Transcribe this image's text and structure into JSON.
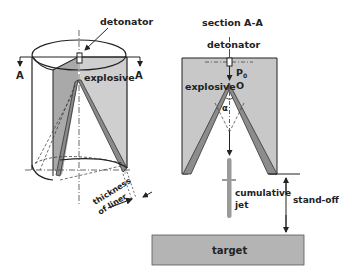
{
  "left_figure": {
    "detonator_label": "detonator",
    "explosive_label": "explosive",
    "section_marker_left": "A",
    "section_marker_right": "A",
    "liner_label_line1": "thickness",
    "liner_label_line2": "of liner"
  },
  "right_figure": {
    "section_label": "section A-A",
    "detonator_label": "detonator",
    "explosive_label": "explosive",
    "pressure_label": "P",
    "pressure_subscript": "0",
    "origin_label": "O",
    "angle_label": "α",
    "jet_label_line1": "cumulative",
    "jet_label_line2": "jet",
    "standoff_label": "stand-off",
    "target_label": "target"
  },
  "colors": {
    "explosive_fill": "#c8c8c8",
    "explosive_dark": "#a8a8a8",
    "liner_fill": "#8c8c8c",
    "target_fill": "#b4b4b4",
    "line": "#222222"
  }
}
